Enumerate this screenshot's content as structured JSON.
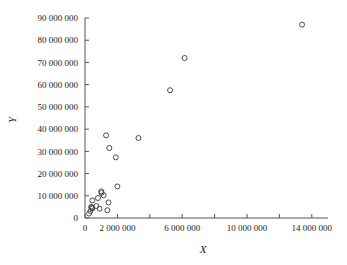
{
  "chart_data": {
    "type": "scatter",
    "title": "",
    "xlabel": "X",
    "ylabel": "Y",
    "xlim": [
      0,
      15000000
    ],
    "ylim": [
      0,
      90000000
    ],
    "grid": false,
    "legend": null,
    "marker_style": "open-circle",
    "xticks": [
      0,
      2000000,
      4000000,
      6000000,
      8000000,
      10000000,
      12000000,
      14000000
    ],
    "xtick_labels": [
      "0",
      "2 000 000",
      "",
      "6 000 000",
      "",
      "10 000 000",
      "",
      "14 000 000"
    ],
    "yticks": [
      0,
      10000000,
      20000000,
      30000000,
      40000000,
      50000000,
      60000000,
      70000000,
      80000000,
      90000000
    ],
    "ytick_labels": [
      "0",
      "10 000 000",
      "20 000 000",
      "30 000 000",
      "40 000 000",
      "50 000 000",
      "60 000 000",
      "70 000 000",
      "80 000 000",
      "90 000 000"
    ],
    "points": [
      {
        "x": 13400000,
        "y": 87000000
      },
      {
        "x": 6150000,
        "y": 72000000
      },
      {
        "x": 5250000,
        "y": 57500000
      },
      {
        "x": 3300000,
        "y": 36000000
      },
      {
        "x": 1300000,
        "y": 37200000
      },
      {
        "x": 1500000,
        "y": 31500000
      },
      {
        "x": 1900000,
        "y": 27300000
      },
      {
        "x": 2000000,
        "y": 14200000
      },
      {
        "x": 1000000,
        "y": 12000000
      },
      {
        "x": 1020000,
        "y": 11300000
      },
      {
        "x": 1150000,
        "y": 10200000
      },
      {
        "x": 800000,
        "y": 9000000
      },
      {
        "x": 450000,
        "y": 7900000
      },
      {
        "x": 1450000,
        "y": 7000000
      },
      {
        "x": 700000,
        "y": 5400000
      },
      {
        "x": 380000,
        "y": 5000000
      },
      {
        "x": 420000,
        "y": 4600000
      },
      {
        "x": 450000,
        "y": 4300000
      },
      {
        "x": 900000,
        "y": 4200000
      },
      {
        "x": 1380000,
        "y": 3500000
      },
      {
        "x": 330000,
        "y": 3100000
      },
      {
        "x": 250000,
        "y": 2000000
      }
    ]
  }
}
